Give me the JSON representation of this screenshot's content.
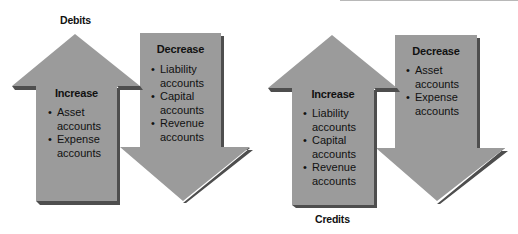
{
  "colors": {
    "arrow_fill": "#9b9b9b",
    "arrow_shadow": "#4e4e4e",
    "text": "#111111"
  },
  "debits": {
    "title": "Debits",
    "increase": {
      "heading": "Increase",
      "items": [
        "Asset accounts",
        "Expense accounts"
      ]
    },
    "decrease": {
      "heading": "Decrease",
      "items": [
        "Liability accounts",
        "Capital accounts",
        "Revenue accounts"
      ]
    }
  },
  "credits": {
    "title": "Credits",
    "increase": {
      "heading": "Increase",
      "items": [
        "Liability accounts",
        "Capital accounts",
        "Revenue accounts"
      ]
    },
    "decrease": {
      "heading": "Decrease",
      "items": [
        "Asset accounts",
        "Expense accounts"
      ]
    }
  }
}
